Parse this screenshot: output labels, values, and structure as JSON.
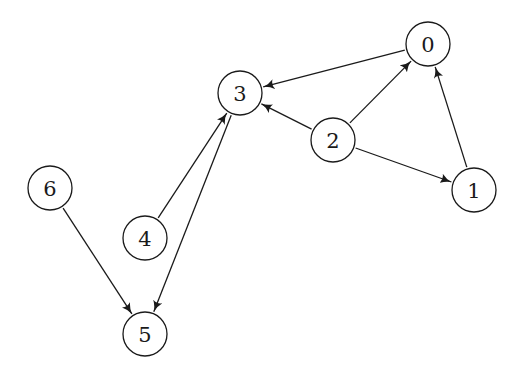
{
  "diagram": {
    "type": "directed-graph",
    "node_radius": 22,
    "colors": {
      "stroke": "#1a1a1a",
      "fill": "#ffffff",
      "background": "#ffffff"
    },
    "nodes": [
      {
        "id": "0",
        "label": "0",
        "x": 428,
        "y": 44
      },
      {
        "id": "1",
        "label": "1",
        "x": 474,
        "y": 190
      },
      {
        "id": "2",
        "label": "2",
        "x": 333,
        "y": 140
      },
      {
        "id": "3",
        "label": "3",
        "x": 240,
        "y": 93
      },
      {
        "id": "4",
        "label": "4",
        "x": 145,
        "y": 238
      },
      {
        "id": "5",
        "label": "5",
        "x": 145,
        "y": 334
      },
      {
        "id": "6",
        "label": "6",
        "x": 50,
        "y": 188
      }
    ],
    "edges": [
      {
        "from": "0",
        "to": "3"
      },
      {
        "from": "2",
        "to": "0"
      },
      {
        "from": "2",
        "to": "3"
      },
      {
        "from": "2",
        "to": "1"
      },
      {
        "from": "1",
        "to": "0"
      },
      {
        "from": "4",
        "to": "3"
      },
      {
        "from": "3",
        "to": "5"
      },
      {
        "from": "6",
        "to": "5"
      }
    ]
  }
}
